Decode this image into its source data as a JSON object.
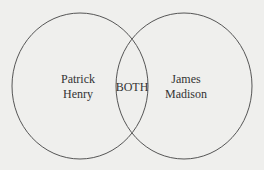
{
  "diagram": {
    "type": "venn",
    "left_set": {
      "line1": "Patrick",
      "line2": "Henry"
    },
    "right_set": {
      "line1": "James",
      "line2": "Madison"
    },
    "intersection": {
      "label": "BOTH"
    },
    "colors": {
      "background": "#efefed",
      "stroke": "#555555",
      "text": "#333333"
    }
  }
}
